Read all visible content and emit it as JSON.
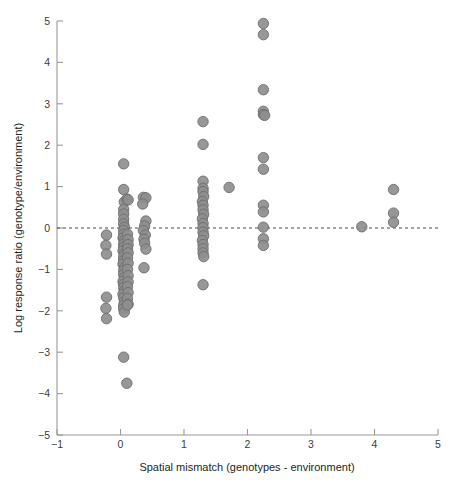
{
  "chart_data": {
    "type": "scatter",
    "title": "",
    "xlabel": "Spatial mismatch (genotypes - environment)",
    "ylabel": "Log response ratio (genotype/environment)",
    "xlim": [
      -1,
      5
    ],
    "ylim": [
      -5,
      5
    ],
    "xticks": [
      -1,
      0,
      1,
      2,
      3,
      4,
      5
    ],
    "xticklabels": [
      "−1",
      "0",
      "1",
      "2",
      "3",
      "4",
      "5"
    ],
    "yticks": [
      -5,
      -4,
      -3,
      -2,
      -1,
      0,
      1,
      2,
      3,
      4,
      5
    ],
    "yticklabels": [
      "−5",
      "−4",
      "−3",
      "−2",
      "−1",
      "0",
      "1",
      "2",
      "3",
      "4",
      "5"
    ],
    "grid": false,
    "legend": null,
    "reference_lines": [
      {
        "orientation": "horizontal",
        "value": 0,
        "style": "dashed",
        "color": "#4a4a4a"
      }
    ],
    "marker": {
      "shape": "circle",
      "radius_px": 5.2,
      "fill": "#8e8e8e",
      "stroke": "#6d6d6d",
      "opacity": 0.92
    },
    "series": [
      {
        "name": "studies",
        "points": [
          [
            -0.22,
            -0.17
          ],
          [
            -0.23,
            -0.42
          ],
          [
            -0.22,
            -0.63
          ],
          [
            -0.22,
            -1.67
          ],
          [
            -0.23,
            -1.94
          ],
          [
            -0.22,
            -2.19
          ],
          [
            0.05,
            1.55
          ],
          [
            0.05,
            0.93
          ],
          [
            0.06,
            0.63
          ],
          [
            0.05,
            0.45
          ],
          [
            0.05,
            0.34
          ],
          [
            0.05,
            0.21
          ],
          [
            0.05,
            0.1
          ],
          [
            0.06,
            0.02
          ],
          [
            0.05,
            -0.06
          ],
          [
            0.05,
            -0.15
          ],
          [
            0.04,
            -0.24
          ],
          [
            0.06,
            -0.31
          ],
          [
            0.05,
            -0.39
          ],
          [
            0.05,
            -0.47
          ],
          [
            0.04,
            -0.55
          ],
          [
            0.06,
            -0.62
          ],
          [
            0.05,
            -0.7
          ],
          [
            0.05,
            -0.79
          ],
          [
            0.04,
            -0.87
          ],
          [
            0.06,
            -0.96
          ],
          [
            0.05,
            -1.03
          ],
          [
            0.05,
            -1.12
          ],
          [
            0.06,
            -1.2
          ],
          [
            0.04,
            -1.29
          ],
          [
            0.05,
            -1.36
          ],
          [
            0.05,
            -1.44
          ],
          [
            0.06,
            -1.52
          ],
          [
            0.04,
            -1.6
          ],
          [
            0.05,
            -1.68
          ],
          [
            0.06,
            -1.78
          ],
          [
            0.05,
            -1.87
          ],
          [
            0.05,
            -1.95
          ],
          [
            0.06,
            -2.03
          ],
          [
            0.1,
            0.7
          ],
          [
            0.12,
            0.68
          ],
          [
            0.11,
            -0.15
          ],
          [
            0.12,
            -0.28
          ],
          [
            0.12,
            -0.4
          ],
          [
            0.11,
            -0.5
          ],
          [
            0.12,
            -0.6
          ],
          [
            0.11,
            -0.72
          ],
          [
            0.12,
            -0.85
          ],
          [
            0.11,
            -1.0
          ],
          [
            0.12,
            -1.15
          ],
          [
            0.12,
            -1.3
          ],
          [
            0.11,
            -1.42
          ],
          [
            0.12,
            -1.56
          ],
          [
            0.11,
            -1.7
          ],
          [
            0.12,
            -1.84
          ],
          [
            0.11,
            -1.86
          ],
          [
            0.36,
            0.74
          ],
          [
            0.4,
            0.73
          ],
          [
            0.35,
            0.58
          ],
          [
            0.4,
            0.17
          ],
          [
            0.38,
            0.05
          ],
          [
            0.36,
            -0.06
          ],
          [
            0.39,
            -0.17
          ],
          [
            0.37,
            -0.27
          ],
          [
            0.38,
            -0.37
          ],
          [
            0.4,
            -0.51
          ],
          [
            0.37,
            -0.96
          ],
          [
            0.05,
            -3.12
          ],
          [
            0.1,
            -3.75
          ],
          [
            1.3,
            2.57
          ],
          [
            1.3,
            2.02
          ],
          [
            1.3,
            1.13
          ],
          [
            1.3,
            0.96
          ],
          [
            1.3,
            0.88
          ],
          [
            1.31,
            0.76
          ],
          [
            1.29,
            0.64
          ],
          [
            1.3,
            0.55
          ],
          [
            1.3,
            0.44
          ],
          [
            1.31,
            0.33
          ],
          [
            1.29,
            0.22
          ],
          [
            1.3,
            0.11
          ],
          [
            1.3,
            0.01
          ],
          [
            1.3,
            -0.1
          ],
          [
            1.31,
            -0.19
          ],
          [
            1.29,
            -0.3
          ],
          [
            1.3,
            -0.4
          ],
          [
            1.3,
            -0.5
          ],
          [
            1.3,
            -0.6
          ],
          [
            1.31,
            -0.69
          ],
          [
            1.3,
            -1.37
          ],
          [
            1.71,
            0.98
          ],
          [
            2.25,
            4.94
          ],
          [
            2.25,
            4.67
          ],
          [
            2.25,
            3.34
          ],
          [
            2.25,
            2.82
          ],
          [
            2.25,
            2.74
          ],
          [
            2.27,
            2.72
          ],
          [
            2.25,
            1.7
          ],
          [
            2.25,
            1.42
          ],
          [
            2.25,
            0.55
          ],
          [
            2.25,
            0.39
          ],
          [
            2.25,
            0.02
          ],
          [
            2.25,
            -0.26
          ],
          [
            2.25,
            -0.42
          ],
          [
            3.8,
            0.03
          ],
          [
            4.3,
            0.93
          ],
          [
            4.3,
            0.36
          ],
          [
            4.3,
            0.14
          ]
        ]
      }
    ],
    "summary": {
      "n_points": 110,
      "x_clusters": [
        -0.22,
        0.05,
        0.11,
        0.38,
        1.3,
        1.71,
        2.25,
        3.8,
        4.3
      ],
      "y_extremes": {
        "max": 4.94,
        "min": -3.75
      }
    }
  },
  "plot_geometry": {
    "x_axis_px": {
      "x_min_value": -1,
      "x_min_px": 57,
      "px_per_unit": 63.5
    },
    "y_axis_px": {
      "y_zero_px": 228,
      "px_per_unit": 41.4
    },
    "axis_color": "#9a9a9a"
  }
}
